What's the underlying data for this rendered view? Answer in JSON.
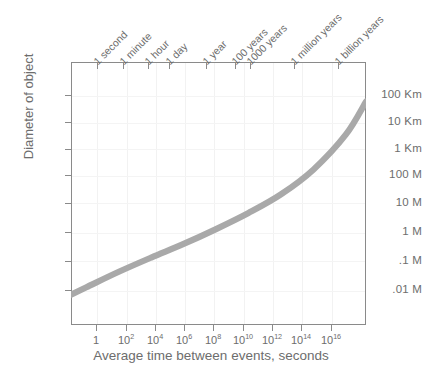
{
  "chart_data": {
    "type": "line",
    "title": "",
    "xlabel": "Average time between events, seconds",
    "ylabel": "Diameter of object",
    "grid": true,
    "legend": "none",
    "x_scale": "log10",
    "y_scale": "log10",
    "xlim_log10": [
      -0.95,
      17.25
    ],
    "ylim_log10": [
      -2.6,
      5.9
    ],
    "x_tick_labels": [
      "1",
      "10²",
      "10⁴",
      "10⁶",
      "10⁸",
      "10¹⁰",
      "10¹²",
      "10¹⁴",
      "10¹⁶"
    ],
    "x_tick_values_log10": [
      0,
      2,
      4,
      6,
      8,
      10,
      12,
      14,
      16
    ],
    "y_tick_labels": [
      "100 Km",
      "10 Km",
      "1 Km",
      "100 M",
      "10 M",
      "1 M",
      ".1 M",
      ".01 M"
    ],
    "y_tick_values_meters_log10": [
      5,
      4,
      3,
      2,
      1,
      0,
      -1,
      -2
    ],
    "secondary_x_axis_label": "",
    "secondary_x_tick_labels": [
      "1 second",
      "1 minute",
      "1 hour",
      "1 day",
      "1 year",
      "100 years",
      "1000 years",
      "1 million years",
      "1 billion years"
    ],
    "secondary_x_tick_seconds_log10": [
      0,
      1.78,
      3.56,
      4.94,
      7.5,
      9.5,
      10.5,
      13.5,
      16.5
    ],
    "series": [
      {
        "name": "impactor diameter vs recurrence interval",
        "points_log10": [
          [
            -0.95,
            -1.62
          ],
          [
            0.0,
            -1.38
          ],
          [
            2.0,
            -0.88
          ],
          [
            4.0,
            -0.42
          ],
          [
            6.0,
            0.02
          ],
          [
            8.0,
            0.5
          ],
          [
            10.0,
            1.02
          ],
          [
            12.0,
            1.62
          ],
          [
            14.0,
            2.42
          ],
          [
            16.0,
            3.55
          ],
          [
            17.25,
            4.62
          ]
        ]
      }
    ],
    "curve_color": "#a9a9a9",
    "axis_color": "#8a8a8a",
    "text_color": "#6d6d6d"
  },
  "axes": {
    "y_title": "Diameter of object",
    "x_title": "Average time between events, seconds",
    "y_ticks": [
      {
        "label": "100 Km",
        "y": 95
      },
      {
        "label": "10 Km",
        "y": 122
      },
      {
        "label": "1 Km",
        "y": 148.5
      },
      {
        "label": "100 M",
        "y": 175
      },
      {
        "label": "10 M",
        "y": 202.5
      },
      {
        "label": "1 M",
        "y": 232
      },
      {
        "label": ".1 M",
        "y": 260.5
      },
      {
        "label": ".01 M",
        "y": 290
      }
    ],
    "x_ticks": [
      {
        "label": "1",
        "sup": "",
        "x": 96
      },
      {
        "label": "10",
        "sup": "2",
        "x": 126
      },
      {
        "label": "10",
        "sup": "4",
        "x": 155
      },
      {
        "label": "10",
        "sup": "6",
        "x": 184
      },
      {
        "label": "10",
        "sup": "8",
        "x": 213
      },
      {
        "label": "10",
        "sup": "10",
        "x": 243
      },
      {
        "label": "10",
        "sup": "12",
        "x": 272
      },
      {
        "label": "10",
        "sup": "14",
        "x": 301
      },
      {
        "label": "10",
        "sup": "16",
        "x": 331
      }
    ],
    "top_ticks": [
      {
        "label": "1 second",
        "x": 97
      },
      {
        "label": "1 minute",
        "x": 123
      },
      {
        "label": "1 hour",
        "x": 148
      },
      {
        "label": "1 day",
        "x": 169
      },
      {
        "label": "1 year",
        "x": 206
      },
      {
        "label": "100 years",
        "x": 235
      },
      {
        "label": "1000 years",
        "x": 250
      },
      {
        "label": "1 million years",
        "x": 294
      },
      {
        "label": "1 billion years",
        "x": 338
      }
    ]
  },
  "curve": {
    "path": "M 71 287.5 C 110 279 140 264 170 250 C 205 234 232 214 258 190 C 284 166 310 135 330 110 C 345 92 356 80 366 70",
    "color": "#a9a9a9",
    "width": 6.2
  }
}
